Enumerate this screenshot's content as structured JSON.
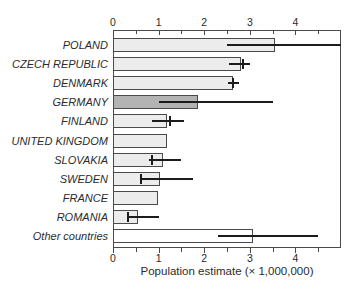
{
  "figure": {
    "background": "#ffffff",
    "kind": "horizontal bar chart with error bars"
  },
  "chart_data": {
    "type": "bar",
    "orientation": "horizontal",
    "title": "",
    "xlabel": "Population estimate (× 1,000,000)",
    "ylabel": "",
    "xlim": [
      0,
      5
    ],
    "x_major_ticks": [
      0,
      1,
      2,
      3,
      4
    ],
    "x_minor_ticks": [
      0.5,
      1.5,
      2.5,
      3.5,
      4.5
    ],
    "axes_shown": [
      "top",
      "bottom"
    ],
    "grid": false,
    "legend": false,
    "categories": [
      "POLAND",
      "CZECH REPUBLIC",
      "DENMARK",
      "GERMANY",
      "FINLAND",
      "UNITED KINGDOM",
      "SLOVAKIA",
      "SWEDEN",
      "FRANCE",
      "ROMANIA",
      "Other countries"
    ],
    "rows": [
      {
        "label": "POLAND",
        "value": 3.55,
        "err_lo": 2.5,
        "err_hi": 5.0,
        "cap": null,
        "fill": "light"
      },
      {
        "label": "CZECH REPUBLIC",
        "value": 2.81,
        "err_lo": 2.55,
        "err_hi": 3.0,
        "cap": 2.86,
        "fill": "light"
      },
      {
        "label": "DENMARK",
        "value": 2.64,
        "err_lo": 2.53,
        "err_hi": 2.76,
        "cap": 2.64,
        "fill": "light"
      },
      {
        "label": "GERMANY",
        "value": 1.86,
        "err_lo": 1.0,
        "err_hi": 3.5,
        "cap": null,
        "fill": "dark"
      },
      {
        "label": "FINLAND",
        "value": 1.19,
        "err_lo": 0.85,
        "err_hi": 1.55,
        "cap": 1.26,
        "fill": "light"
      },
      {
        "label": "UNITED KINGDOM",
        "value": 1.19,
        "err_lo": null,
        "err_hi": null,
        "cap": null,
        "fill": "light"
      },
      {
        "label": "SLOVAKIA",
        "value": 1.09,
        "err_lo": 0.8,
        "err_hi": 1.5,
        "cap": 0.85,
        "fill": "light"
      },
      {
        "label": "SWEDEN",
        "value": 1.02,
        "err_lo": 0.6,
        "err_hi": 1.75,
        "cap": 0.62,
        "fill": "light"
      },
      {
        "label": "FRANCE",
        "value": 0.99,
        "err_lo": null,
        "err_hi": null,
        "cap": null,
        "fill": "light"
      },
      {
        "label": "ROMANIA",
        "value": 0.55,
        "err_lo": 0.3,
        "err_hi": 1.0,
        "cap": 0.32,
        "fill": "light"
      },
      {
        "label": "Other countries",
        "value": 3.08,
        "err_lo": 2.3,
        "err_hi": 4.5,
        "cap": null,
        "fill": "white"
      }
    ],
    "colors": {
      "bar_light": "#ececec",
      "bar_dark": "#b3b3b3",
      "bar_white": "#ffffff",
      "bar_border": "#4a4a4a",
      "error_bar": "#1c1c1c",
      "axis": "#4a4a4a",
      "text": "#2b2b2b"
    }
  }
}
